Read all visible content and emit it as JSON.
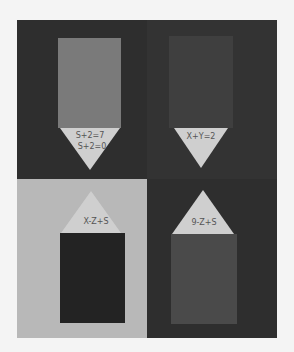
{
  "colors": {
    "background": "#f4f4f4",
    "board": "#2e2e2e",
    "light_quadrant": "#b8b8b8",
    "rect_top_left": "#7a7a7a",
    "rect_top_right": "#3f3f3f",
    "rect_bottom_left": "#232323",
    "rect_bottom_right": "#4a4a4a",
    "triangle": "#cfcfcf"
  },
  "panels": [
    {
      "position": "top-left",
      "labels": [
        "S+2=7",
        "S+2=0"
      ]
    },
    {
      "position": "top-right",
      "labels": [
        "X+Y=2"
      ]
    },
    {
      "position": "bottom-left",
      "labels": [
        "X-Z+S"
      ]
    },
    {
      "position": "bottom-right",
      "labels": [
        "9-Z+S"
      ]
    }
  ]
}
